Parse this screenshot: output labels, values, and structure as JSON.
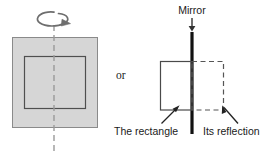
{
  "figure": {
    "background_color": "#ffffff",
    "width": 270,
    "height": 157
  },
  "colors": {
    "square_fill": "#d6d6d6",
    "square_stroke": "#7d7d7d",
    "inner_rect_stroke": "#555555",
    "axis_dashed": "#9a9a9a",
    "mirror": "#111111",
    "rect_stroke": "#4a4a4a",
    "reflection_stroke": "#555555",
    "text": "#1a1a1a",
    "arrow": "#222222"
  },
  "left_panel": {
    "name": "rotation-diagram",
    "square": {
      "x": 12,
      "y": 37,
      "width": 85,
      "height": 90,
      "fill": "#d6d6d6"
    },
    "inner_rectangle": {
      "x": 24,
      "y": 56,
      "width": 61,
      "height": 52
    },
    "rotation_axis": {
      "x": 54,
      "y_top": 25,
      "y_bottom": 152,
      "style": "dashed"
    },
    "rotation_arrow": {
      "label": "rotation-arrow",
      "direction": "clockwise-around-vertical-axis"
    }
  },
  "connector": {
    "or_label": "or"
  },
  "right_panel": {
    "name": "mirror-diagram",
    "mirror_label": "Mirror",
    "mirror_line": {
      "x": 192,
      "y_top": 32,
      "y_bottom": 134
    },
    "mirror_pointer": {
      "from_y": 18,
      "to_y": 31,
      "style": "down-arrow"
    },
    "object_rectangle": {
      "x": 160,
      "y": 61,
      "width": 32,
      "height": 49,
      "style": "solid"
    },
    "reflection_rectangle": {
      "x": 192,
      "y": 61,
      "width": 32,
      "height": 49,
      "style": "dashed"
    },
    "object_label": "The rectangle",
    "reflection_label": "Its reflection"
  }
}
